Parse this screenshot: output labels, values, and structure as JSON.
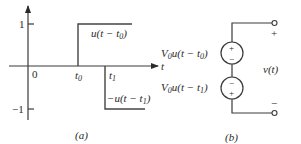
{
  "panel_a": {
    "caption": "(a)",
    "origin_label": "0",
    "t_axis_label": "t",
    "y_ticks": [
      {
        "label": "1",
        "value": 1
      },
      {
        "label": "−1",
        "value": -1
      }
    ],
    "x_ticks": [
      {
        "label": "t",
        "sub": "0"
      },
      {
        "label": "t",
        "sub": "1"
      }
    ],
    "step_up_label": {
      "prefix": "u(t − t",
      "sub": "0",
      "suffix": ")"
    },
    "step_down_label": {
      "prefix": "−u(t − t",
      "sub": "1",
      "suffix": ")"
    },
    "colors": {
      "line": "#3a3a3a",
      "signal": "#444444",
      "text": "#2a2a2a"
    }
  },
  "panel_b": {
    "caption": "(b)",
    "source_top": {
      "prefix": "V",
      "v_sub": "0",
      "mid": "u(t − t",
      "t_sub": "0",
      "suffix": ")",
      "polarity_top": "+",
      "polarity_bottom": "−"
    },
    "source_bottom": {
      "prefix": "V",
      "v_sub": "0",
      "mid": "u(t − t",
      "t_sub": "1",
      "suffix": ")",
      "polarity_top": "−",
      "polarity_bottom": "+"
    },
    "output_label": "v(t)",
    "terminal_plus": "+",
    "terminal_minus": "−"
  }
}
